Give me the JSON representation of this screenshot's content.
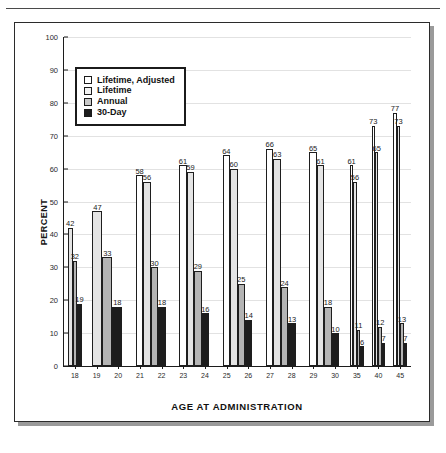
{
  "figure": {
    "top_rule": true,
    "ylabel": "PERCENT",
    "xlabel": "AGE AT ADMINISTRATION"
  },
  "legend": {
    "entries": [
      {
        "label": "Lifetime, Adjusted",
        "swatch": "legend-swatch-lifetime-adjusted",
        "color": "#ffffff"
      },
      {
        "label": "Lifetime",
        "swatch": "legend-swatch-lifetime",
        "color": "#f2f2f2"
      },
      {
        "label": "Annual",
        "swatch": "legend-swatch-annual",
        "color": "#c9c9c9"
      },
      {
        "label": "30-Day",
        "swatch": "legend-swatch-30-day",
        "color": "#1d1d1d"
      }
    ]
  },
  "chart_data": {
    "type": "bar",
    "title": "",
    "xlabel": "AGE AT ADMINISTRATION",
    "ylabel": "PERCENT",
    "ylim": [
      0,
      100
    ],
    "yticks": [
      0,
      10,
      20,
      30,
      40,
      50,
      60,
      70,
      80,
      90,
      100
    ],
    "grid": true,
    "legend_position": "upper-left-inside",
    "categories": [
      "18",
      "19",
      "20",
      "21",
      "22",
      "23",
      "24",
      "25",
      "26",
      "27",
      "28",
      "29",
      "30",
      "35",
      "40",
      "45"
    ],
    "group_labels": [
      "18",
      "19",
      "20",
      "21",
      "22",
      "23",
      "24",
      "25",
      "26",
      "27",
      "28",
      "29",
      "30",
      "35",
      "40",
      "45"
    ],
    "series": [
      {
        "name": "Lifetime, Adjusted",
        "color": "#ffffff",
        "values": [
          null,
          null,
          58,
          null,
          61,
          null,
          64,
          null,
          66,
          null,
          65,
          null,
          null,
          61,
          73,
          77
        ]
      },
      {
        "name": "Lifetime",
        "color": "#f2f2f2",
        "values": [
          42,
          47,
          56,
          null,
          59,
          null,
          60,
          null,
          63,
          null,
          61,
          null,
          null,
          56,
          65,
          73
        ]
      },
      {
        "name": "Annual",
        "color": "#c9c9c9",
        "values": [
          32,
          33,
          30,
          null,
          29,
          null,
          25,
          null,
          24,
          null,
          18,
          null,
          null,
          11,
          12,
          13
        ]
      },
      {
        "name": "30-Day",
        "color": "#1d1d1d",
        "values": [
          19,
          18,
          18,
          null,
          16,
          null,
          14,
          null,
          13,
          null,
          10,
          null,
          null,
          6,
          7,
          7
        ]
      }
    ],
    "groups": [
      {
        "label": "18",
        "tick_labels": [
          "18"
        ],
        "bars": [
          {
            "series": "Lifetime",
            "value": 42
          },
          {
            "series": "Annual",
            "value": 32
          },
          {
            "series": "30-Day",
            "value": 19
          }
        ]
      },
      {
        "label": "19-20",
        "tick_labels": [
          "19",
          "20"
        ],
        "bars": [
          {
            "series": "Lifetime",
            "value": 47
          },
          {
            "series": "Annual",
            "value": 33
          },
          {
            "series": "30-Day",
            "value": 18
          }
        ]
      },
      {
        "label": "21-22",
        "tick_labels": [
          "21",
          "22"
        ],
        "bars": [
          {
            "series": "Lifetime, Adjusted",
            "value": 58
          },
          {
            "series": "Lifetime",
            "value": 56
          },
          {
            "series": "Annual",
            "value": 30
          },
          {
            "series": "30-Day",
            "value": 18
          }
        ]
      },
      {
        "label": "23-24",
        "tick_labels": [
          "23",
          "24"
        ],
        "bars": [
          {
            "series": "Lifetime, Adjusted",
            "value": 61
          },
          {
            "series": "Lifetime",
            "value": 59
          },
          {
            "series": "Annual",
            "value": 29
          },
          {
            "series": "30-Day",
            "value": 16
          }
        ]
      },
      {
        "label": "25-26",
        "tick_labels": [
          "25",
          "26"
        ],
        "bars": [
          {
            "series": "Lifetime, Adjusted",
            "value": 64
          },
          {
            "series": "Lifetime",
            "value": 60
          },
          {
            "series": "Annual",
            "value": 25
          },
          {
            "series": "30-Day",
            "value": 14
          }
        ]
      },
      {
        "label": "27-28",
        "tick_labels": [
          "27",
          "28"
        ],
        "bars": [
          {
            "series": "Lifetime, Adjusted",
            "value": 66
          },
          {
            "series": "Lifetime",
            "value": 63
          },
          {
            "series": "Annual",
            "value": 24
          },
          {
            "series": "30-Day",
            "value": 13
          }
        ]
      },
      {
        "label": "29-30",
        "tick_labels": [
          "29",
          "30"
        ],
        "bars": [
          {
            "series": "Lifetime, Adjusted",
            "value": 65
          },
          {
            "series": "Lifetime",
            "value": 61
          },
          {
            "series": "Annual",
            "value": 18
          },
          {
            "series": "30-Day",
            "value": 10
          }
        ]
      },
      {
        "label": "35",
        "tick_labels": [
          "35"
        ],
        "bars": [
          {
            "series": "Lifetime, Adjusted",
            "value": 61
          },
          {
            "series": "Lifetime",
            "value": 56
          },
          {
            "series": "Annual",
            "value": 11
          },
          {
            "series": "30-Day",
            "value": 6
          }
        ]
      },
      {
        "label": "40",
        "tick_labels": [
          "40"
        ],
        "bars": [
          {
            "series": "Lifetime, Adjusted",
            "value": 73
          },
          {
            "series": "Lifetime",
            "value": 65
          },
          {
            "series": "Annual",
            "value": 12
          },
          {
            "series": "30-Day",
            "value": 7
          }
        ]
      },
      {
        "label": "45",
        "tick_labels": [
          "45"
        ],
        "bars": [
          {
            "series": "Lifetime, Adjusted",
            "value": 77
          },
          {
            "series": "Lifetime",
            "value": 73
          },
          {
            "series": "Annual",
            "value": 13
          },
          {
            "series": "30-Day",
            "value": 7
          }
        ]
      }
    ]
  }
}
